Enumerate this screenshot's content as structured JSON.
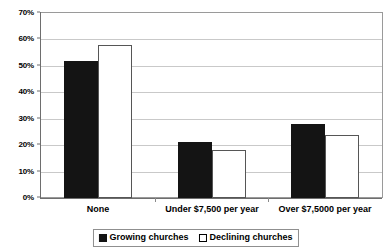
{
  "chart_data": {
    "type": "bar",
    "title": "",
    "subtitle": "",
    "xlabel": "",
    "ylabel": "",
    "categories": [
      "None",
      "Under $7,500 per year",
      "Over $7,5000 per year"
    ],
    "series": [
      {
        "name": "Growing churches",
        "values": [
          52,
          21,
          28
        ],
        "color": "#141414",
        "fill": "solid"
      },
      {
        "name": "Declining churches",
        "values": [
          58,
          18,
          24
        ],
        "color": "#ffffff",
        "fill": "outline"
      }
    ],
    "ylim": [
      0,
      70
    ],
    "ytick_step": 10,
    "ytick_labels": [
      "0%",
      "10%",
      "20%",
      "30%",
      "40%",
      "50%",
      "60%",
      "70%"
    ],
    "ytick_values": [
      0,
      10,
      20,
      30,
      40,
      50,
      60,
      70
    ],
    "value_format": "percent",
    "grid": true,
    "grid_axis": "y",
    "legend": true,
    "legend_position": "bottom",
    "plot_border": true,
    "background_color": "#ffffff",
    "gridline_color": "#c9c9c9",
    "axis_color": "#6e6e6e"
  },
  "axis": {
    "y_ticks": [
      {
        "label": "70%",
        "value": 70
      },
      {
        "label": "60%",
        "value": 60
      },
      {
        "label": "50%",
        "value": 50
      },
      {
        "label": "40%",
        "value": 40
      },
      {
        "label": "30%",
        "value": 30
      },
      {
        "label": "20%",
        "value": 20
      },
      {
        "label": "10%",
        "value": 10
      },
      {
        "label": "0%",
        "value": 0
      }
    ],
    "x_labels": [
      "None",
      "Under $7,500 per year",
      "Over $7,5000 per year"
    ]
  },
  "legend": {
    "items": [
      {
        "label": "Growing churches",
        "marker": "filled-square",
        "color": "#141414"
      },
      {
        "label": "Declining churches",
        "marker": "outlined-square",
        "color": "#ffffff"
      }
    ]
  }
}
